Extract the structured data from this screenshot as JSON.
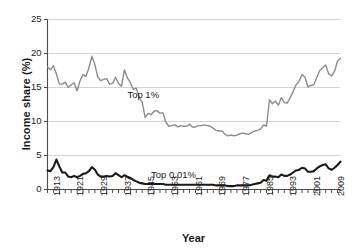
{
  "chart_data": {
    "type": "line",
    "title": "",
    "xlabel": "Year",
    "ylabel": "Income share (%)",
    "xlim": [
      1913,
      2012
    ],
    "ylim": [
      0,
      25
    ],
    "grid": true,
    "grid_axis": "y",
    "legend_position": "inline-annotations",
    "ytick_labels": [
      "0",
      "5",
      "10",
      "15",
      "20",
      "25"
    ],
    "ytick_values": [
      0,
      5,
      10,
      15,
      20,
      25
    ],
    "xtick_labels": [
      "1913",
      "1921",
      "1929",
      "1937",
      "1945",
      "1953",
      "1961",
      "1969",
      "1977",
      "1985",
      "1993",
      "2001",
      "2009"
    ],
    "xtick_values": [
      1913,
      1921,
      1929,
      1937,
      1945,
      1953,
      1961,
      1969,
      1977,
      1985,
      1993,
      2001,
      2009
    ],
    "xminor_step": 2,
    "x": [
      1913,
      1914,
      1915,
      1916,
      1917,
      1918,
      1919,
      1920,
      1921,
      1922,
      1923,
      1924,
      1925,
      1926,
      1927,
      1928,
      1929,
      1930,
      1931,
      1932,
      1933,
      1934,
      1935,
      1936,
      1937,
      1938,
      1939,
      1940,
      1941,
      1942,
      1943,
      1944,
      1945,
      1946,
      1947,
      1948,
      1949,
      1950,
      1951,
      1952,
      1953,
      1954,
      1955,
      1956,
      1957,
      1958,
      1959,
      1960,
      1961,
      1962,
      1963,
      1964,
      1965,
      1966,
      1967,
      1968,
      1969,
      1970,
      1971,
      1972,
      1973,
      1974,
      1975,
      1976,
      1977,
      1978,
      1979,
      1980,
      1981,
      1982,
      1983,
      1984,
      1985,
      1986,
      1987,
      1988,
      1989,
      1990,
      1991,
      1992,
      1993,
      1994,
      1995,
      1996,
      1997,
      1998,
      1999,
      2000,
      2001,
      2002,
      2003,
      2004,
      2005,
      2006,
      2007,
      2008,
      2009,
      2010,
      2011,
      2012
    ],
    "series": [
      {
        "name": "Top 1%",
        "color": "#8c8c8c",
        "linewidth": 1.4,
        "label_text": "Top 1%",
        "label_x": 1940,
        "label_y": 13.9,
        "values": [
          18.0,
          17.6,
          18.2,
          17.0,
          15.5,
          15.5,
          15.8,
          15.0,
          15.4,
          15.7,
          14.5,
          16.0,
          16.9,
          16.6,
          17.9,
          19.6,
          18.4,
          16.5,
          16.0,
          16.2,
          16.3,
          15.5,
          15.6,
          16.5,
          15.6,
          15.2,
          17.6,
          16.4,
          15.7,
          14.7,
          14.9,
          13.5,
          12.8,
          10.6,
          11.2,
          11.0,
          11.5,
          11.6,
          11.2,
          11.3,
          9.9,
          9.3,
          9.4,
          9.5,
          9.2,
          9.4,
          9.3,
          9.3,
          9.6,
          9.2,
          9.2,
          9.4,
          9.4,
          9.5,
          9.4,
          9.3,
          9.0,
          8.7,
          8.6,
          8.6,
          8.1,
          7.9,
          8.0,
          7.9,
          8.0,
          8.2,
          8.3,
          8.2,
          8.1,
          8.4,
          8.6,
          8.7,
          8.9,
          9.5,
          9.3,
          13.2,
          12.6,
          13.0,
          12.4,
          13.5,
          12.8,
          12.7,
          13.5,
          14.4,
          15.4,
          15.9,
          16.9,
          16.5,
          15.1,
          15.3,
          15.4,
          16.5,
          17.5,
          17.9,
          18.3,
          17.0,
          16.7,
          17.4,
          18.9,
          19.3
        ]
      },
      {
        "name": "Top 0.01%",
        "color": "#1a1a1a",
        "linewidth": 2.1,
        "label_text": "Top 0.01%",
        "label_x": 1948,
        "label_y": 2.2,
        "values": [
          2.8,
          2.7,
          3.3,
          4.4,
          3.4,
          2.5,
          2.5,
          1.9,
          1.8,
          2.0,
          1.8,
          2.0,
          2.3,
          2.4,
          2.7,
          3.3,
          2.9,
          2.2,
          1.9,
          1.9,
          2.0,
          1.9,
          2.0,
          2.4,
          2.1,
          1.8,
          2.1,
          1.9,
          1.7,
          1.4,
          1.2,
          1.0,
          0.9,
          0.8,
          0.8,
          0.8,
          0.8,
          0.8,
          0.8,
          0.8,
          0.7,
          0.7,
          0.7,
          0.7,
          0.7,
          0.7,
          0.7,
          0.7,
          0.7,
          0.7,
          0.7,
          0.7,
          0.7,
          0.7,
          0.7,
          0.7,
          0.7,
          0.6,
          0.6,
          0.6,
          0.6,
          0.5,
          0.5,
          0.5,
          0.6,
          0.6,
          0.6,
          0.6,
          0.6,
          0.7,
          0.8,
          0.9,
          1.0,
          1.4,
          1.3,
          2.1,
          1.9,
          1.9,
          1.8,
          2.2,
          2.0,
          2.0,
          2.2,
          2.5,
          2.8,
          2.9,
          3.2,
          3.1,
          2.6,
          2.6,
          2.7,
          3.1,
          3.4,
          3.6,
          3.7,
          3.1,
          2.9,
          3.2,
          3.6,
          4.1
        ]
      }
    ]
  }
}
